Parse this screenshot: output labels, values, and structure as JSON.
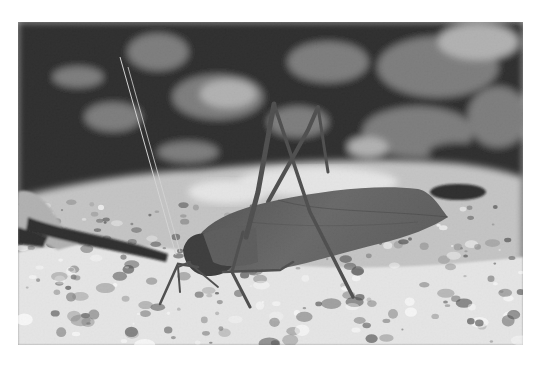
{
  "image": {
    "subject": "leaf-mimic katydid on gravel ground",
    "color_mode": "grayscale",
    "alt": "Black-and-white photograph of a leaf-mimicking katydid standing on sandy gravel with dark leaf litter in the background"
  },
  "palette": {
    "page_background": "#ffffff",
    "background_dark": "#141414",
    "background_mid": "#6e6e6e",
    "leaf_light": "#a8a8a8",
    "ground_light": "#e2e2e2",
    "ground_mid": "#bdbdbd",
    "insect_body": "#4a4a4a",
    "insect_dark": "#262626",
    "insect_legs": "#3a3a3a",
    "antenna": "#d0d0d0"
  }
}
